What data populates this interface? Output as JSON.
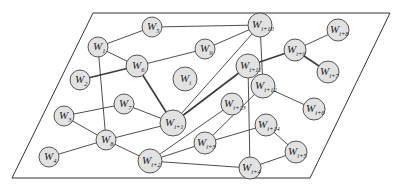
{
  "diagram": {
    "type": "network-graph",
    "colors": {
      "node_fill": "#e2e2e2",
      "node_stroke": "#444444",
      "edge": "#3a3a3a",
      "plane_stroke": "#333333"
    },
    "plane": {
      "points": [
        [
          93,
          13
        ],
        [
          390,
          13
        ],
        [
          310,
          178
        ],
        [
          12,
          178
        ]
      ]
    },
    "nodes": [
      {
        "id": "W1",
        "base": "W",
        "sub": "1",
        "x": 98,
        "y": 47,
        "r": 10
      },
      {
        "id": "W5",
        "base": "W",
        "sub": "5",
        "x": 152,
        "y": 27,
        "r": 10
      },
      {
        "id": "W6",
        "base": "W",
        "sub": "6",
        "x": 137,
        "y": 66,
        "r": 11
      },
      {
        "id": "W9",
        "base": "W",
        "sub": "9",
        "x": 205,
        "y": 49,
        "r": 10
      },
      {
        "id": "Wi",
        "base": "W",
        "sub": "i",
        "x": 185,
        "y": 79,
        "r": 12
      },
      {
        "id": "Wi10",
        "base": "W",
        "sub": "i+10",
        "x": 260,
        "y": 25,
        "r": 12
      },
      {
        "id": "Wi9",
        "base": "W",
        "sub": "i+9",
        "x": 295,
        "y": 50,
        "r": 11
      },
      {
        "id": "Wi8",
        "base": "W",
        "sub": "i+8",
        "x": 338,
        "y": 30,
        "r": 11
      },
      {
        "id": "Wi7",
        "base": "W",
        "sub": "i+7",
        "x": 328,
        "y": 72,
        "r": 11
      },
      {
        "id": "Wi11",
        "base": "W",
        "sub": "i+11",
        "x": 248,
        "y": 66,
        "r": 12
      },
      {
        "id": "Wi12",
        "base": "W",
        "sub": "i+12",
        "x": 263,
        "y": 86,
        "r": 12
      },
      {
        "id": "Wi6",
        "base": "W",
        "sub": "i+6",
        "x": 314,
        "y": 109,
        "r": 11
      },
      {
        "id": "W2",
        "base": "W",
        "sub": "2",
        "x": 80,
        "y": 80,
        "r": 10
      },
      {
        "id": "W3",
        "base": "W",
        "sub": "3",
        "x": 64,
        "y": 116,
        "r": 10
      },
      {
        "id": "W7",
        "base": "W",
        "sub": "7",
        "x": 124,
        "y": 104,
        "r": 10
      },
      {
        "id": "Wi1",
        "base": "W",
        "sub": "i+1",
        "x": 173,
        "y": 123,
        "r": 13
      },
      {
        "id": "Wi13",
        "base": "W",
        "sub": "i+13",
        "x": 232,
        "y": 104,
        "r": 11
      },
      {
        "id": "Wi14",
        "base": "W",
        "sub": "i+14",
        "x": 266,
        "y": 125,
        "r": 11
      },
      {
        "id": "W8",
        "base": "W",
        "sub": "8",
        "x": 106,
        "y": 140,
        "r": 10
      },
      {
        "id": "W4",
        "base": "W",
        "sub": "4",
        "x": 49,
        "y": 157,
        "r": 10
      },
      {
        "id": "Wi2",
        "base": "W",
        "sub": "i+2",
        "x": 150,
        "y": 161,
        "r": 12
      },
      {
        "id": "Wi3",
        "base": "W",
        "sub": "i+3",
        "x": 205,
        "y": 143,
        "r": 11
      },
      {
        "id": "Wi4",
        "base": "W",
        "sub": "i+4",
        "x": 250,
        "y": 168,
        "r": 11
      },
      {
        "id": "Wi5",
        "base": "W",
        "sub": "i+5",
        "x": 296,
        "y": 152,
        "r": 11
      }
    ],
    "edges": [
      {
        "from": "W1",
        "to": "W5"
      },
      {
        "from": "W1",
        "to": "W6"
      },
      {
        "from": "W1",
        "to": "W8"
      },
      {
        "from": "W2",
        "to": "W6",
        "thick": true
      },
      {
        "from": "W5",
        "to": "Wi10"
      },
      {
        "from": "W6",
        "to": "W9"
      },
      {
        "from": "W6",
        "to": "Wi1",
        "thick": true
      },
      {
        "from": "W9",
        "to": "Wi10"
      },
      {
        "from": "Wi10",
        "to": "Wi1"
      },
      {
        "from": "Wi10",
        "to": "Wi12"
      },
      {
        "from": "Wi11",
        "to": "Wi9",
        "thick": true
      },
      {
        "from": "Wi11",
        "to": "Wi1",
        "thick": true
      },
      {
        "from": "Wi11",
        "to": "Wi4"
      },
      {
        "from": "Wi9",
        "to": "Wi8"
      },
      {
        "from": "Wi9",
        "to": "Wi7",
        "thick": true
      },
      {
        "from": "Wi12",
        "to": "Wi6"
      },
      {
        "from": "Wi12",
        "to": "Wi3"
      },
      {
        "from": "W3",
        "to": "W7"
      },
      {
        "from": "W3",
        "to": "W8"
      },
      {
        "from": "W7",
        "to": "Wi1"
      },
      {
        "from": "W8",
        "to": "Wi1"
      },
      {
        "from": "W8",
        "to": "W4"
      },
      {
        "from": "W8",
        "to": "Wi2"
      },
      {
        "from": "Wi13",
        "to": "Wi2"
      },
      {
        "from": "Wi2",
        "to": "Wi3"
      },
      {
        "from": "Wi2",
        "to": "Wi4"
      },
      {
        "from": "Wi3",
        "to": "Wi14"
      },
      {
        "from": "Wi14",
        "to": "Wi5"
      },
      {
        "from": "Wi5",
        "to": "Wi4"
      }
    ]
  }
}
